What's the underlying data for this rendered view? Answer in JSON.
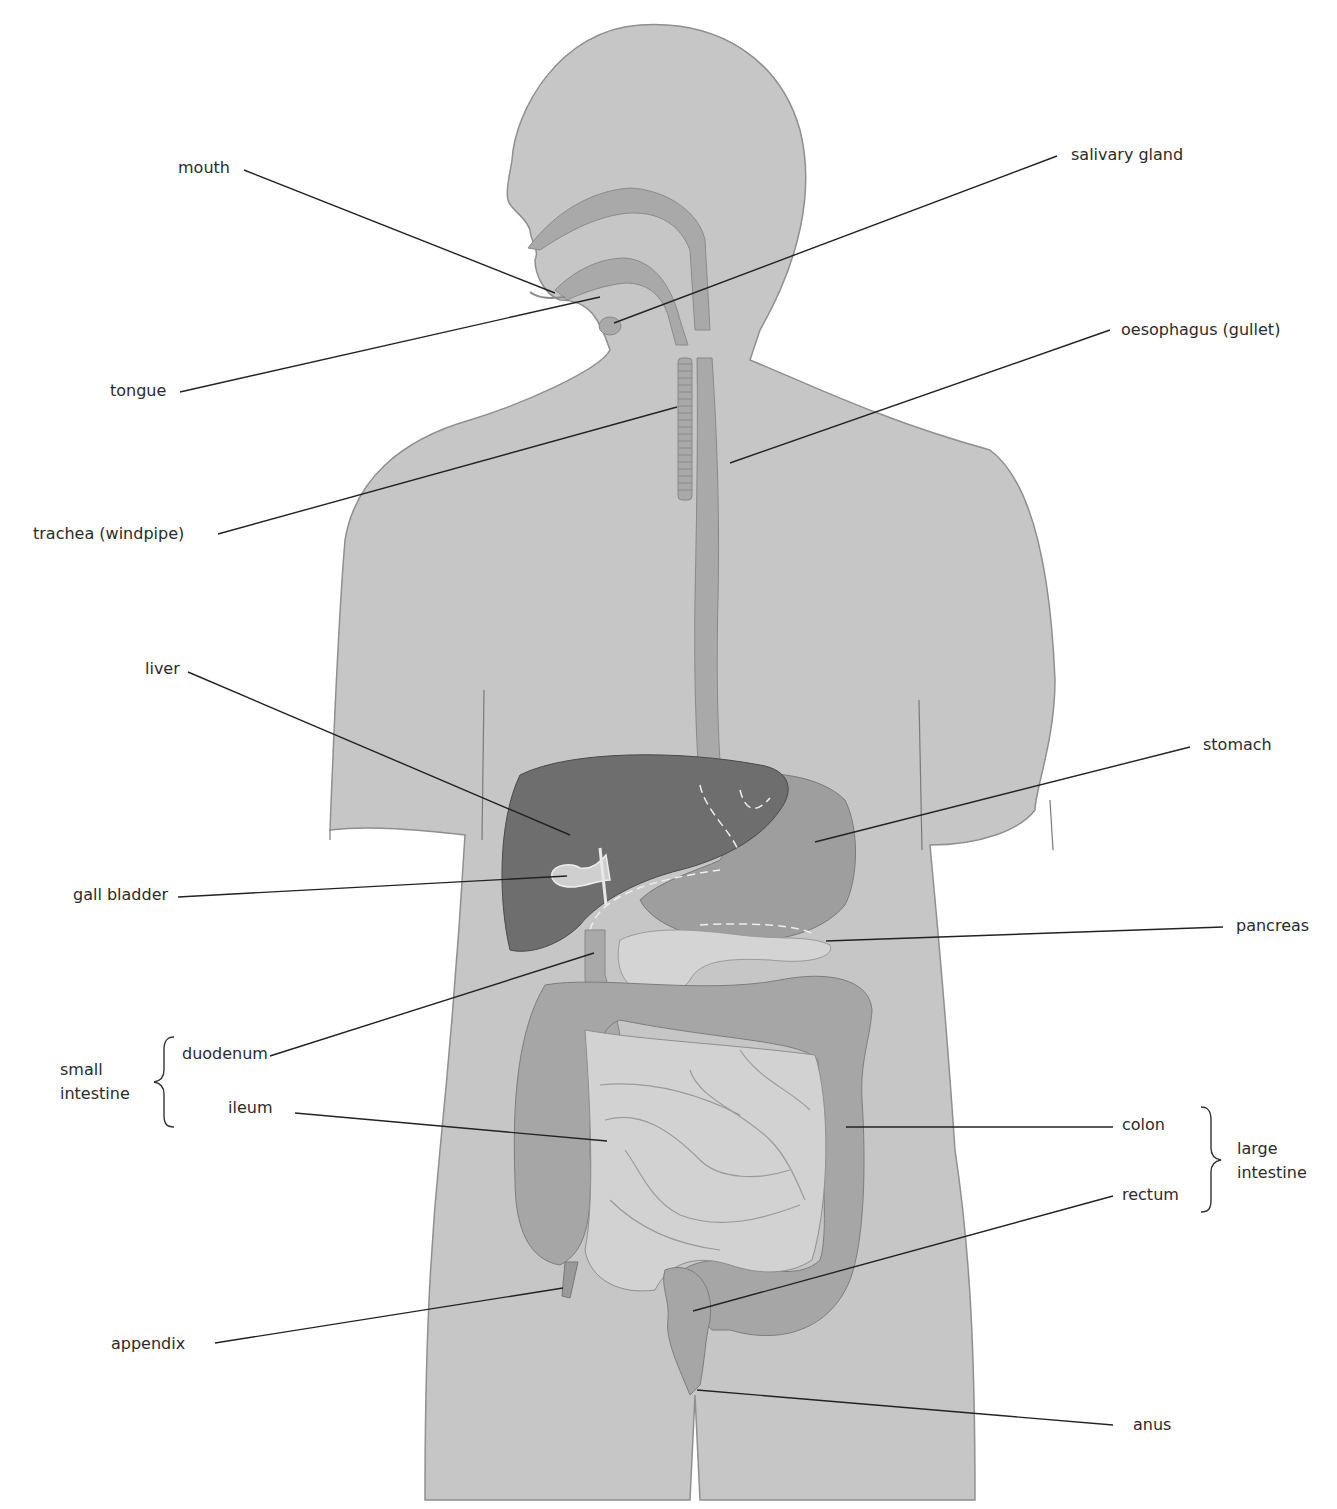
{
  "diagram": {
    "colors": {
      "body": "#c6c6c6",
      "body_outline": "#8f8f8f",
      "tract": "#a9a9a9",
      "liver": "#6e6e6e",
      "stomach": "#9e9e9e",
      "pancreas": "#d4d4d4",
      "small_intestine": "#cfcfcf",
      "colon": "#a6a6a6",
      "leader_line": "#222222",
      "dashed": "#eeeeee"
    },
    "labels": {
      "mouth": "mouth",
      "tongue": "tongue",
      "trachea": "trachea (windpipe)",
      "salivary_gland": "salivary gland",
      "oesophagus": "oesophagus (gullet)",
      "liver": "liver",
      "gall_bladder": "gall bladder",
      "stomach": "stomach",
      "pancreas": "pancreas",
      "duodenum": "duodenum",
      "ileum": "ileum",
      "colon": "colon",
      "rectum": "rectum",
      "appendix": "appendix",
      "anus": "anus"
    },
    "groups": {
      "small_intestine": {
        "line1": "small",
        "line2": "intestine",
        "members": [
          "duodenum",
          "ileum"
        ]
      },
      "large_intestine": {
        "line1": "large",
        "line2": "intestine",
        "members": [
          "colon",
          "rectum"
        ]
      }
    }
  }
}
